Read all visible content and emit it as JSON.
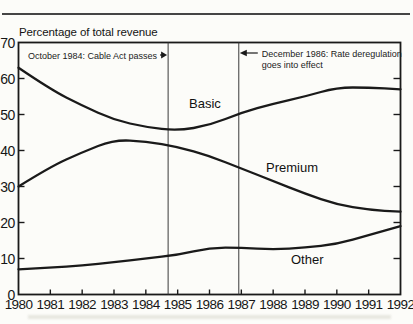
{
  "figure": {
    "top_caption_cutoff": "Television Operators, 1980–1992",
    "axis_title": "Percentage of total revenue"
  },
  "chart_data": {
    "type": "line",
    "title": "Percentage of total revenue",
    "xlabel": "",
    "ylabel": "Percentage of total revenue",
    "x": [
      1980,
      1981,
      1982,
      1983,
      1984,
      1985,
      1986,
      1987,
      1988,
      1989,
      1990,
      1991,
      1992
    ],
    "xlim": [
      1980,
      1992
    ],
    "ylim": [
      0,
      70
    ],
    "yticks": [
      0,
      10,
      20,
      30,
      40,
      50,
      60,
      70
    ],
    "xticks": [
      1980,
      1981,
      1982,
      1983,
      1984,
      1985,
      1986,
      1987,
      1988,
      1989,
      1990,
      1991,
      1992
    ],
    "grid": false,
    "legend": "inline-labels",
    "series": [
      {
        "name": "Basic",
        "values": [
          63,
          57,
          52.5,
          48.5,
          46.5,
          45.5,
          47,
          50.5,
          53,
          55,
          57.5,
          57.5,
          57
        ]
      },
      {
        "name": "Premium",
        "values": [
          30,
          35.5,
          39.5,
          43,
          42.5,
          41,
          38.5,
          35,
          31.5,
          28,
          25,
          23.5,
          23
        ]
      },
      {
        "name": "Other",
        "values": [
          7,
          7.5,
          8,
          9,
          10,
          11,
          13,
          13,
          12.5,
          13,
          14,
          16.5,
          19
        ]
      }
    ],
    "annotations": [
      {
        "lines": [
          "October 1984: Cable Act passes"
        ],
        "x_year": 1984.7,
        "arrow": "right"
      },
      {
        "lines": [
          "December 1986: Rate deregulation",
          "goes into effect"
        ],
        "x_year": 1986.92,
        "arrow": "left"
      }
    ]
  },
  "colors": {
    "ink": "#1a1a1a",
    "rule": "#454545",
    "annotation_line": "#3a3a3a",
    "background": "#fcfcf9"
  }
}
